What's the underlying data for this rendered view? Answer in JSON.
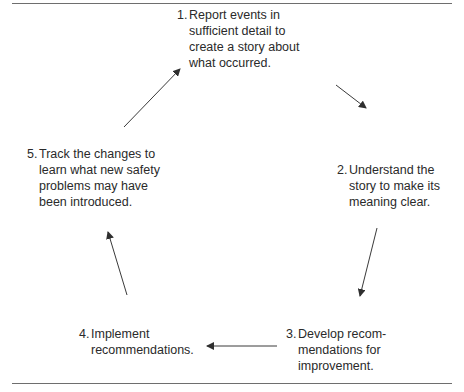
{
  "diagram": {
    "type": "cycle",
    "steps": [
      {
        "number": "1.",
        "text": "Report events in\nsufficient detail to\ncreate a story about\nwhat occurred."
      },
      {
        "number": "2.",
        "text": "Understand the\nstory to make its\nmeaning clear."
      },
      {
        "number": "3.",
        "text": "Develop recom-\nmendations for\nimprovement."
      },
      {
        "number": "4.",
        "text": "Implement\nrecommendations."
      },
      {
        "number": "5.",
        "text": "Track the changes to\nlearn what new safety\nproblems may have\nbeen introduced."
      }
    ],
    "arrows": [
      {
        "from": "1",
        "to": "2"
      },
      {
        "from": "2",
        "to": "3"
      },
      {
        "from": "3",
        "to": "4"
      },
      {
        "from": "4",
        "to": "5"
      },
      {
        "from": "5",
        "to": "1"
      }
    ],
    "colors": {
      "text": "#2a2a2a",
      "arrow": "#3a3a3a",
      "rule": "#6e6e6e"
    }
  }
}
